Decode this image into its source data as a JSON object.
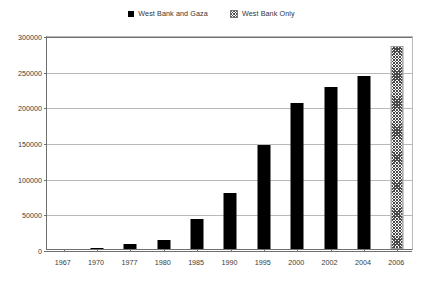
{
  "chart_data": {
    "type": "bar",
    "title": "",
    "xlabel": "",
    "ylabel": "",
    "ylim": [
      0,
      300000
    ],
    "ytick_labels": [
      "0",
      "50000",
      "100000",
      "150000",
      "200000",
      "250000",
      "300000"
    ],
    "ytick_values": [
      0,
      50000,
      100000,
      150000,
      200000,
      250000,
      300000
    ],
    "grid": true,
    "legend_position": "top-center",
    "categories": [
      "1967",
      "1970",
      "1977",
      "1980",
      "1985",
      "1990",
      "1995",
      "2000",
      "2002",
      "2004",
      "2006"
    ],
    "series": [
      {
        "name": "West Bank and Gaza",
        "marker": "solid-black-square",
        "values": [
          0,
          1200,
          7000,
          12500,
          42000,
          78000,
          146000,
          204000,
          227000,
          242000,
          null
        ]
      },
      {
        "name": "West Bank Only",
        "marker": "hatched-square",
        "values": [
          null,
          null,
          null,
          null,
          null,
          null,
          null,
          null,
          null,
          null,
          284000
        ]
      }
    ]
  },
  "legend": {
    "entries": [
      {
        "label": "West Bank and Gaza",
        "swatch": "solid-black-square"
      },
      {
        "label": "West Bank Only",
        "swatch": "hatched-square"
      }
    ]
  }
}
